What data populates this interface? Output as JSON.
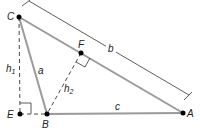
{
  "diagram": {
    "colors": {
      "side": "#9a9a9a",
      "line": "#333333",
      "point": "#000000",
      "text": "#222222"
    },
    "points": {
      "C": {
        "label": "C",
        "x": 19,
        "y": 17
      },
      "A": {
        "label": "A",
        "x": 183,
        "y": 113
      },
      "B": {
        "label": "B",
        "x": 47,
        "y": 114
      },
      "E": {
        "label": "E",
        "x": 20,
        "y": 114
      },
      "F": {
        "label": "F",
        "x": 81,
        "y": 53
      }
    },
    "sides": {
      "a": "a",
      "b": "b",
      "c": "c"
    },
    "altitudes": {
      "h1": {
        "base": "h",
        "sub": "1"
      },
      "h2": {
        "base": "h",
        "sub": "2"
      }
    }
  }
}
